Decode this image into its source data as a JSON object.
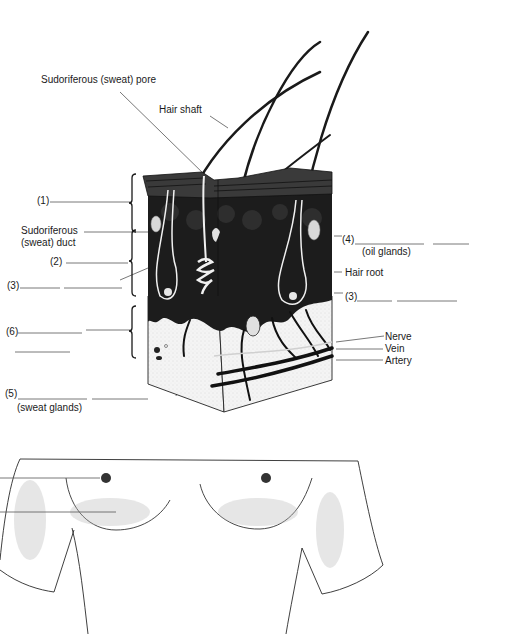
{
  "skin_diagram": {
    "labels": {
      "pore": "Sudoriferous (sweat) pore",
      "hair_shaft": "Hair shaft",
      "blank1_num": "(1)",
      "duct_line1": "Sudoriferous",
      "duct_line2": "(sweat) duct",
      "blank2_num": "(2)",
      "blank3_left_num": "(3)",
      "blank6_num": "(6)",
      "blank5_num": "(5)",
      "blank5_hint": "(sweat glands)",
      "blank4_num": "(4)",
      "blank4_hint": "(oil glands)",
      "hair_root": "Hair root",
      "blank3_right_num": "(3)",
      "nerve": "Nerve",
      "vein": "Vein",
      "artery": "Artery"
    },
    "colors": {
      "ink": "#1a1a1a",
      "dermis": "#1c1c1c",
      "epidermis": "#3a3a3a",
      "hypodermis": "#f2f2f2",
      "leader": "#555555"
    }
  },
  "torso_diagram": {
    "leader_lines": 2,
    "colors": {
      "outline": "#2a2a2a",
      "shading": "#bbbbbb"
    }
  }
}
